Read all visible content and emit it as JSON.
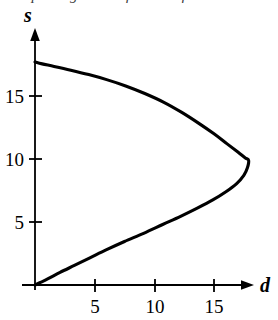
{
  "figure": {
    "clipped_caption_fragment": "exploring the usefulness of numbers to",
    "background_color": "#ffffff",
    "ink_color": "#000000"
  },
  "chart_data": {
    "type": "line",
    "title": "",
    "subtitle": "",
    "xlabel": "d",
    "ylabel": "s",
    "xlim": [
      0,
      18.5
    ],
    "ylim": [
      0,
      19.5
    ],
    "grid": false,
    "legend": null,
    "xticks": [
      5,
      10,
      15
    ],
    "xtick_labels": [
      "5",
      "10",
      "15"
    ],
    "yticks": [
      5,
      10,
      15
    ],
    "ytick_labels": [
      "5",
      "10",
      "15"
    ],
    "axis_arrows": {
      "x": "right",
      "y": "up"
    },
    "vertex": {
      "d": 17.9,
      "s": 9.9
    },
    "series": [
      {
        "name": "curve",
        "points": [
          {
            "d": 0.0,
            "s": 17.7
          },
          {
            "d": 0.6,
            "s": 17.55
          },
          {
            "d": 1.6,
            "s": 17.35
          },
          {
            "d": 3.0,
            "s": 17.05
          },
          {
            "d": 4.5,
            "s": 16.7
          },
          {
            "d": 6.0,
            "s": 16.3
          },
          {
            "d": 7.6,
            "s": 15.8
          },
          {
            "d": 9.2,
            "s": 15.2
          },
          {
            "d": 10.8,
            "s": 14.5
          },
          {
            "d": 12.3,
            "s": 13.7
          },
          {
            "d": 13.7,
            "s": 12.85
          },
          {
            "d": 15.0,
            "s": 12.0
          },
          {
            "d": 16.1,
            "s": 11.2
          },
          {
            "d": 17.0,
            "s": 10.55
          },
          {
            "d": 17.6,
            "s": 10.1
          },
          {
            "d": 17.9,
            "s": 9.9
          },
          {
            "d": 17.8,
            "s": 9.3
          },
          {
            "d": 17.5,
            "s": 8.7
          },
          {
            "d": 16.9,
            "s": 8.05
          },
          {
            "d": 16.0,
            "s": 7.4
          },
          {
            "d": 14.9,
            "s": 6.75
          },
          {
            "d": 13.6,
            "s": 6.1
          },
          {
            "d": 12.2,
            "s": 5.45
          },
          {
            "d": 10.7,
            "s": 4.8
          },
          {
            "d": 9.1,
            "s": 4.1
          },
          {
            "d": 7.5,
            "s": 3.45
          },
          {
            "d": 6.0,
            "s": 2.8
          },
          {
            "d": 4.6,
            "s": 2.15
          },
          {
            "d": 3.3,
            "s": 1.55
          },
          {
            "d": 2.1,
            "s": 1.0
          },
          {
            "d": 1.1,
            "s": 0.5
          },
          {
            "d": 0.4,
            "s": 0.18
          },
          {
            "d": 0.0,
            "s": 0.0
          }
        ]
      }
    ]
  }
}
